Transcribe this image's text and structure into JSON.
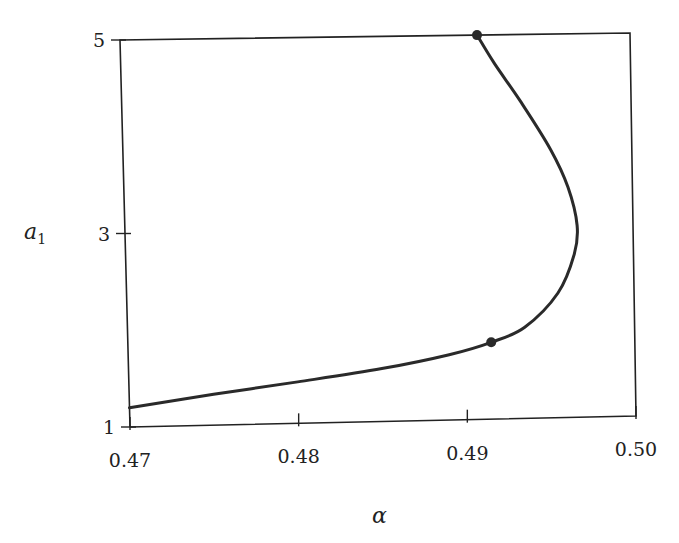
{
  "chart_data": {
    "type": "line",
    "title": "",
    "xlabel": "α",
    "ylabel": "a1",
    "ylabel_main": "a",
    "ylabel_sub": "1",
    "xlim": [
      0.47,
      0.5
    ],
    "ylim": [
      1,
      5
    ],
    "grid": false,
    "legend": null,
    "x_ticks": [
      "0.47",
      "0.48",
      "0.49",
      "0.50"
    ],
    "y_ticks": [
      "1",
      "3",
      "5"
    ],
    "series": [
      {
        "name": "a1(alpha)",
        "x": [
          0.47,
          0.475,
          0.48,
          0.485,
          0.489,
          0.4915,
          0.4935,
          0.4955,
          0.4965,
          0.4967,
          0.4962,
          0.4952,
          0.4935,
          0.492,
          0.491
        ],
        "y": [
          1.2,
          1.32,
          1.43,
          1.55,
          1.68,
          1.8,
          1.95,
          2.3,
          2.7,
          3.0,
          3.4,
          3.8,
          4.3,
          4.7,
          5.0
        ]
      }
    ],
    "markers": [
      {
        "x": 0.491,
        "y": 5.0
      },
      {
        "x": 0.4915,
        "y": 1.8
      }
    ]
  }
}
